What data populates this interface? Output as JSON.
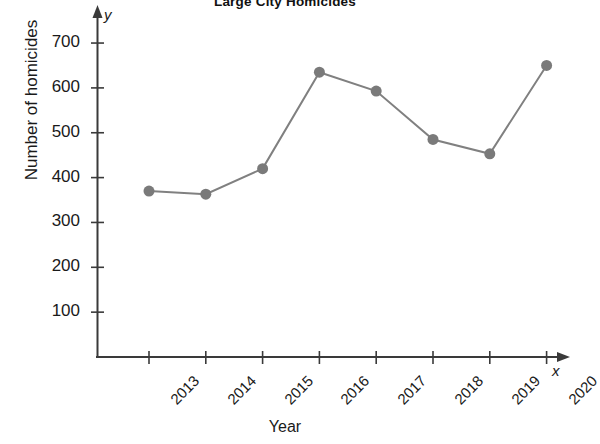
{
  "chart_data": {
    "type": "line",
    "title": "Large City Homicides",
    "xlabel": "Year",
    "ylabel": "Number of homicides",
    "categories": [
      "2013",
      "2014",
      "2015",
      "2016",
      "2017",
      "2018",
      "2019",
      "2020"
    ],
    "values": [
      370,
      363,
      420,
      635,
      593,
      485,
      453,
      650
    ],
    "x": [
      2013,
      2014,
      2015,
      2016,
      2017,
      2018,
      2019,
      2020
    ],
    "ylim": [
      0,
      740
    ],
    "ytick_labels": [
      "700",
      "600",
      "500",
      "400",
      "300",
      "200",
      "100"
    ],
    "ytick_values": [
      700,
      600,
      500,
      400,
      300,
      200,
      100
    ],
    "grid": false,
    "legend": "none",
    "axis_y_variable": "y",
    "axis_x_variable": "x",
    "series_color": "#808080",
    "marker_color": "#7a7a7a",
    "axis_color": "#3a3a3a",
    "marker": "circle",
    "marker_size": 11,
    "line_width": 2
  },
  "figure": {
    "background_color": "#ffffff",
    "text_color": "#1a1a1a"
  }
}
